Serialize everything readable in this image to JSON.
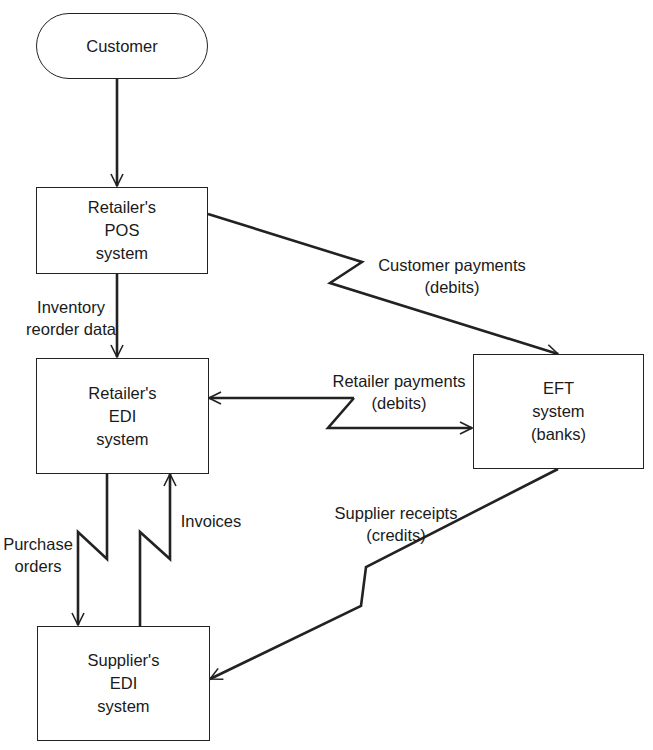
{
  "diagram": {
    "type": "flowchart",
    "nodes": {
      "customer": {
        "label": "Customer",
        "shape": "terminator"
      },
      "retailer_pos": {
        "label": "Retailer's\nPOS\nsystem",
        "shape": "process"
      },
      "retailer_edi": {
        "label": "Retailer's\nEDI\nsystem",
        "shape": "process"
      },
      "eft": {
        "label": "EFT\nsystem\n(banks)",
        "shape": "process"
      },
      "supplier_edi": {
        "label": "Supplier's\nEDI\nsystem",
        "shape": "process"
      }
    },
    "edges": {
      "customer_to_pos": {
        "from": "Customer",
        "to": "Retailer's POS system",
        "label": "",
        "style": "straight"
      },
      "inventory_reorder": {
        "from": "Retailer's POS system",
        "to": "Retailer's EDI system",
        "label": "Inventory\nreorder data",
        "style": "straight"
      },
      "customer_payments": {
        "from": "Retailer's POS system",
        "to": "EFT system (banks)",
        "label": "Customer payments\n(debits)",
        "style": "telecom-zigzag"
      },
      "retailer_payments": {
        "from": "Retailer's EDI system",
        "to": "EFT system (banks)",
        "label": "Retailer payments\n(debits)",
        "style": "telecom-zigzag",
        "bidirectional": true
      },
      "purchase_orders": {
        "from": "Retailer's EDI system",
        "to": "Supplier's EDI system",
        "label": "Purchase\norders",
        "style": "telecom-zigzag"
      },
      "invoices": {
        "from": "Supplier's EDI system",
        "to": "Retailer's EDI system",
        "label": "Invoices",
        "style": "telecom-zigzag"
      },
      "supplier_receipts": {
        "from": "EFT system (banks)",
        "to": "Supplier's EDI system",
        "label": "Supplier receipts\n(credits)",
        "style": "telecom-zigzag"
      }
    },
    "colors": {
      "stroke": "#222222",
      "background": "#ffffff",
      "text": "#1a1a1a"
    }
  }
}
